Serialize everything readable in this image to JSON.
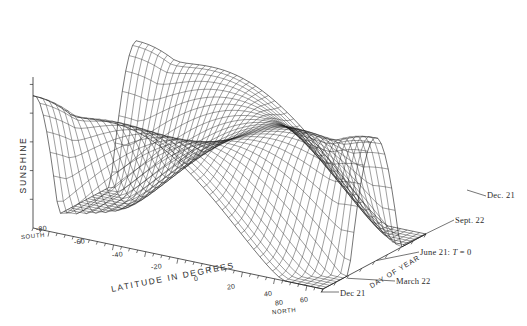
{
  "figure": {
    "type": "surface-3d-wireframe",
    "background": "#ffffff",
    "line_color": "#1a1a1a"
  },
  "axes": {
    "vertical": {
      "label": "SUNSHINE",
      "tick_count": 5,
      "tick_labels": []
    },
    "latitude": {
      "label": "LATITUDE IN DEGREES",
      "ticks": [
        "-80",
        "-60",
        "-40",
        "-20",
        "0",
        "20",
        "40",
        "60",
        "80"
      ],
      "end_label_low": "SOUTH",
      "end_label_high": "NORTH"
    },
    "day": {
      "label": "DAY OF YEAR",
      "origin_label": "Dec 21",
      "markers": [
        {
          "text": "March 22"
        },
        {
          "text": "June 21: ",
          "italic": "T",
          "tail": " = 0"
        },
        {
          "text": "Sept. 22"
        },
        {
          "text": "Dec. 21"
        }
      ]
    }
  },
  "chart_data": {
    "type": "surface",
    "title": "",
    "xlabel": "LATITUDE IN DEGREES",
    "ylabel": "DAY OF YEAR",
    "zlabel": "SUNSHINE",
    "xlim": [
      -90,
      90
    ],
    "ylim": [
      0,
      365
    ],
    "zlim": [
      0,
      1
    ],
    "grid": true,
    "legend": false,
    "x": [
      -90,
      -80,
      -70,
      -60,
      -50,
      -40,
      -30,
      -20,
      -10,
      0,
      10,
      20,
      30,
      40,
      50,
      60,
      70,
      80,
      90
    ],
    "y": [
      0,
      91,
      182,
      273,
      365
    ],
    "y_tick_names": [
      "Dec 21",
      "March 22",
      "June 21",
      "Sept. 22",
      "Dec. 21"
    ]
  },
  "labels": {
    "sunshine": "SUNSHINE",
    "latitude": "LATITUDE IN DEGREES",
    "day_of_year": "DAY OF YEAR",
    "south": "SOUTH",
    "north": "NORTH",
    "dec21_origin": "Dec 21",
    "march22": "March 22",
    "june21_pre": "June 21: ",
    "june21_var": "T",
    "june21_post": " = 0",
    "sept22": "Sept. 22",
    "dec21_end": "Dec. 21",
    "t_m80": "-80",
    "t_m60": "-60",
    "t_m40": "-40",
    "t_m20": "-20",
    "t_0": "0",
    "t_20": "20",
    "t_40": "40",
    "t_60": "60",
    "t_80": "80"
  }
}
